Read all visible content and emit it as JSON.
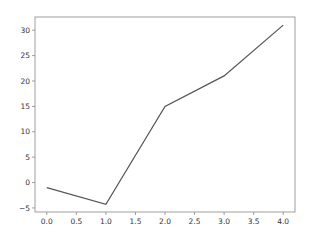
{
  "chart_data": {
    "type": "line",
    "title": "",
    "xlabel": "",
    "ylabel": "",
    "x": [
      0,
      1,
      2,
      3,
      4
    ],
    "series": [
      {
        "name": "",
        "values": [
          -1,
          -4.3,
          15,
          21,
          31
        ],
        "color": "#555555"
      }
    ],
    "x_ticks": [
      "0.0",
      "0.5",
      "1.0",
      "1.5",
      "2.0",
      "2.5",
      "3.0",
      "3.5",
      "4.0"
    ],
    "y_ticks": [
      "-5",
      "0",
      "5",
      "10",
      "15",
      "20",
      "25",
      "30"
    ],
    "xlim": [
      -0.2,
      4.2
    ],
    "ylim": [
      -5.8,
      32.6
    ],
    "grid": false,
    "legend": null
  }
}
